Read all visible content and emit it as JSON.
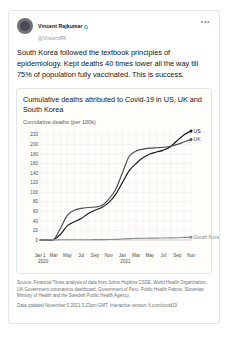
{
  "tweet": {
    "display_name": "Vincent Rajkumar",
    "verified_badge": "verified-badge",
    "handle": "@VincentRK",
    "more_label": "•••",
    "body": "South Korea followed the textbook principles of epidemiology. Kept deaths 40 times lower all the way till 75% of population fully vaccinated. This is success."
  },
  "chart_card": {
    "title": "Cumulative deaths attributed to Covid-19 in US, UK and South Korea",
    "subtitle": "Cumulative deaths (per 100k)",
    "source": "Source: Financial Times analysis of data from Johns Hopkins CSSE, World Health Organization, UK Government coronavirus dashboard, Government of Peru, Public Health France, Slovenian Ministry of Health and the Swedish Public Health Agency.",
    "updated": "Data updated November 5 2021 3.23pm GMT. Interactive version: ft.com/covid19"
  },
  "chart_data": {
    "type": "line",
    "title": "Cumulative deaths attributed to Covid-19 in US, UK and South Korea",
    "subtitle": "Cumulative deaths (per 100k)",
    "xlabel": "",
    "ylabel": "Cumulative deaths (per 100k)",
    "ylim": [
      0,
      230
    ],
    "yticks": [
      20,
      40,
      60,
      80,
      100,
      120,
      140,
      160,
      180,
      200,
      220
    ],
    "grid": true,
    "legend_position": "line-end-labels",
    "x_tick_labels": [
      "Jan 1",
      "Mar",
      "May",
      "Jul",
      "Sep",
      "Nov",
      "Jan",
      "Mar",
      "May",
      "Jul",
      "Sep",
      "Nov"
    ],
    "x_year_labels": [
      "2020",
      "2021"
    ],
    "x": [
      "2020-01",
      "2020-02",
      "2020-03",
      "2020-04",
      "2020-05",
      "2020-06",
      "2020-07",
      "2020-08",
      "2020-09",
      "2020-10",
      "2020-11",
      "2020-12",
      "2021-01",
      "2021-02",
      "2021-03",
      "2021-04",
      "2021-05",
      "2021-06",
      "2021-07",
      "2021-08",
      "2021-09",
      "2021-10",
      "2021-11"
    ],
    "series": [
      {
        "name": "US",
        "color": "#1a1a1a",
        "end_label": "US",
        "end_value": 228,
        "values": [
          0,
          0,
          1,
          12,
          30,
          38,
          45,
          55,
          62,
          68,
          78,
          95,
          120,
          145,
          160,
          172,
          180,
          184,
          188,
          195,
          208,
          220,
          228
        ]
      },
      {
        "name": "UK",
        "color": "#4d4d4d",
        "end_label": "UK",
        "end_value": 210,
        "values": [
          0,
          0,
          1,
          25,
          52,
          62,
          66,
          68,
          69,
          72,
          85,
          105,
          140,
          175,
          186,
          190,
          192,
          193,
          194,
          196,
          200,
          205,
          210
        ]
      },
      {
        "name": "South Korea",
        "color": "#8a8d90",
        "end_label": "South Korea",
        "end_value": 6,
        "values": [
          0,
          0,
          0.3,
          0.5,
          0.5,
          0.6,
          0.6,
          0.6,
          0.7,
          0.9,
          1.0,
          1.3,
          2.1,
          3.0,
          3.3,
          3.6,
          3.9,
          4.0,
          4.2,
          4.4,
          4.8,
          5.4,
          6.0
        ]
      }
    ]
  },
  "colors": {
    "accent": "#1d9bf0",
    "us_line": "#1a1a1a",
    "uk_line": "#4d4d4d",
    "sk_line": "#8a8d90",
    "grid": "#dfe2e6",
    "card_bg": "#fffdfa"
  }
}
